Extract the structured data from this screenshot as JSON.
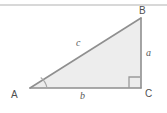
{
  "figure": {
    "name": "right-triangle-abc",
    "background_color": "#ffffff",
    "top_rule_color": "#d8d8d8",
    "fill_color": "#ededed",
    "stroke_color": "#8c8c8c",
    "label_color": "#4f4f4f",
    "side_label_color": "#5a5a5a",
    "vertices": {
      "A": {
        "label": "A",
        "x": 30,
        "y": 88
      },
      "B": {
        "label": "B",
        "x": 141,
        "y": 18
      },
      "C": {
        "label": "C",
        "x": 141,
        "y": 88
      }
    },
    "sides": {
      "a": {
        "label": "a",
        "from": "B",
        "to": "C"
      },
      "b": {
        "label": "b",
        "from": "A",
        "to": "C"
      },
      "c": {
        "label": "c",
        "from": "A",
        "to": "B"
      }
    },
    "markers": {
      "right_angle_at": "C",
      "angle_arc_at": "A"
    }
  }
}
